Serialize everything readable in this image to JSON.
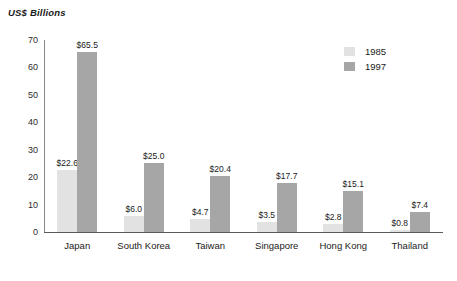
{
  "chart_data": {
    "type": "bar",
    "title": "",
    "ylabel": "US$ Billions",
    "xlabel": "",
    "ylim": [
      0,
      70
    ],
    "yticks": [
      70,
      60,
      50,
      40,
      30,
      20,
      10,
      0
    ],
    "grid": false,
    "legend_position": "top-right",
    "categories": [
      "Japan",
      "South Korea",
      "Taiwan",
      "Singapore",
      "Hong Kong",
      "Thailand"
    ],
    "series": [
      {
        "name": "1985",
        "color": "#e2e2e2",
        "values": [
          22.6,
          6.0,
          4.7,
          3.5,
          2.8,
          0.8
        ],
        "labels": [
          "$22.6",
          "$6.0",
          "$4.7",
          "$3.5",
          "$2.8",
          "$0.8"
        ]
      },
      {
        "name": "1997",
        "color": "#a6a6a6",
        "values": [
          65.5,
          25.0,
          20.4,
          17.7,
          15.1,
          7.4
        ],
        "labels": [
          "$65.5",
          "$25.0",
          "$20.4",
          "$17.7",
          "$15.1",
          "$7.4"
        ]
      }
    ]
  },
  "legend": {
    "items": [
      {
        "label": "1985",
        "color": "#e2e2e2"
      },
      {
        "label": "1997",
        "color": "#a6a6a6"
      }
    ]
  },
  "colors": {
    "series_1985": "#e2e2e2",
    "series_1997": "#a6a6a6",
    "axis": "#5a5a5a",
    "text": "#1a1a1a",
    "background": "#ffffff"
  }
}
